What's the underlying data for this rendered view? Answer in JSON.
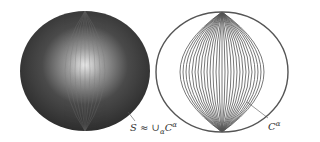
{
  "figure": {
    "left_sphere": {
      "label": "S ≈ ∪ₐCᵃ",
      "label_text": "S ≈ ∪αCα",
      "style": "shaded"
    },
    "right_sphere": {
      "label": "Cα",
      "style": "wireframe"
    }
  },
  "labels": {
    "left": "S ≈ ∪",
    "left_sub": "α",
    "left_c": "C",
    "left_sup": "α",
    "right_c": "C",
    "right_sup": "α"
  }
}
